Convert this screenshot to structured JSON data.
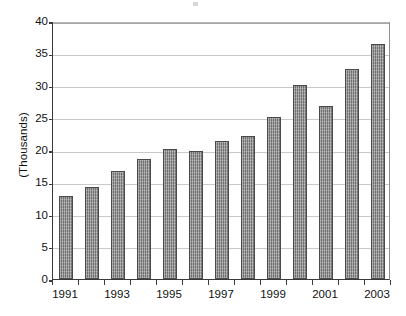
{
  "chart_data": {
    "type": "bar",
    "title": "",
    "subtitle": "",
    "xlabel": "",
    "ylabel": "(Thousands)",
    "categories": [
      "1991",
      "1992",
      "1993",
      "1994",
      "1995",
      "1996",
      "1997",
      "1998",
      "1999",
      "2000",
      "2001",
      "2002",
      "2003"
    ],
    "values": [
      12.8,
      14.2,
      16.7,
      18.6,
      20.1,
      19.8,
      21.4,
      22.2,
      25.1,
      30.1,
      26.8,
      32.5,
      36.5
    ],
    "ylim": [
      0,
      40
    ],
    "ytick_values": [
      0,
      5,
      10,
      15,
      20,
      25,
      30,
      35,
      40
    ],
    "ytick_labels": [
      "0",
      "5",
      "10",
      "15",
      "20",
      "25",
      "30",
      "35",
      "40"
    ],
    "xtick_labels": [
      "1991",
      "1993",
      "1995",
      "1997",
      "1999",
      "2001",
      "2003"
    ],
    "xtick_label_categories": [
      "1991",
      "1993",
      "1995",
      "1997",
      "1999",
      "2001",
      "2003"
    ],
    "grid": "horizontal",
    "legend": "none",
    "series": [
      {
        "name": "",
        "values": [
          12.8,
          14.2,
          16.7,
          18.6,
          20.1,
          19.8,
          21.4,
          22.2,
          25.1,
          30.1,
          26.8,
          32.5,
          36.5
        ]
      }
    ],
    "colors": {
      "bar_fill": "#8d8d8d",
      "bar_border": "#4a4a4a",
      "gridline": "#c9c9c9",
      "axis": "#3a3a3a",
      "text": "#111111",
      "background": "#ffffff"
    }
  }
}
